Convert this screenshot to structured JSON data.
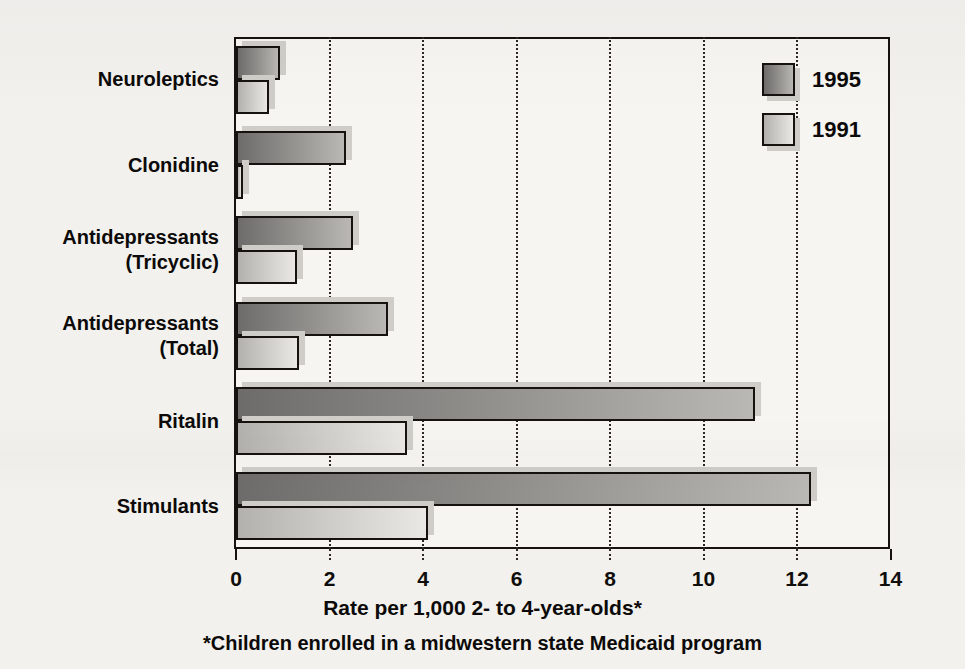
{
  "chart_data": {
    "type": "bar",
    "orientation": "horizontal",
    "title": "",
    "xlabel": "Rate per 1,000 2- to 4-year-olds*",
    "ylabel": "",
    "footnote": "*Children enrolled in a midwestern state Medicaid program",
    "categories": [
      "Neuroleptics",
      "Clonidine",
      "Antidepressants (Tricyclic)",
      "Antidepressants (Total)",
      "Ritalin",
      "Stimulants"
    ],
    "category_lines": [
      [
        "Neuroleptics"
      ],
      [
        "Clonidine"
      ],
      [
        "Antidepressants",
        "(Tricyclic)"
      ],
      [
        "Antidepressants",
        "(Total)"
      ],
      [
        "Ritalin"
      ],
      [
        "Stimulants"
      ]
    ],
    "series": [
      {
        "name": "1995",
        "values": [
          0.95,
          2.35,
          2.5,
          3.25,
          11.1,
          12.3
        ]
      },
      {
        "name": "1991",
        "values": [
          0.7,
          0.15,
          1.3,
          1.35,
          3.65,
          4.1
        ]
      }
    ],
    "xlim": [
      0,
      14
    ],
    "xticks": [
      0,
      2,
      4,
      6,
      8,
      10,
      12,
      14
    ],
    "xtick_labels": [
      "0",
      "2",
      "4",
      "6",
      "8",
      "10",
      "12",
      "14"
    ],
    "grid": "vertical-dotted",
    "legend_position": "top-right",
    "colors": {
      "series_1995": "#8e8d8a",
      "series_1991": "#cecdc9",
      "axis": "#15120f",
      "background": "#f2f1ee"
    }
  },
  "legend": {
    "entries": [
      {
        "label": "1995"
      },
      {
        "label": "1991"
      }
    ]
  },
  "axis": {
    "x_title": "Rate per 1,000 2- to 4-year-olds*"
  },
  "notes": {
    "footnote": "*Children enrolled in a midwestern state Medicaid program"
  }
}
